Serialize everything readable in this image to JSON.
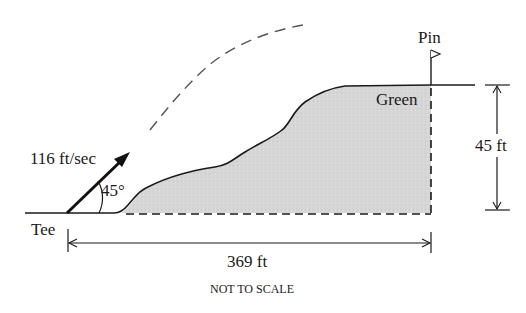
{
  "diagram": {
    "labels": {
      "pin": "Pin",
      "green": "Green",
      "velocity": "116 ft/sec",
      "angle": "45°",
      "tee": "Tee",
      "height": "45 ft",
      "distance": "369 ft",
      "note": "NOT TO SCALE"
    },
    "colors": {
      "line": "#1a1a1a",
      "fill": "#d9d9d9",
      "dashed": "#555555"
    }
  }
}
